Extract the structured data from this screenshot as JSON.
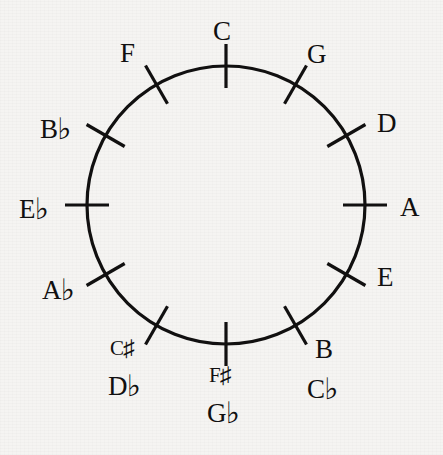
{
  "diagram": {
    "background_color": "#f5f4f2",
    "stroke_color": "#111010",
    "center_x": 226,
    "center_y": 205,
    "radius": 139,
    "tick_inner_offset": 22,
    "tick_outer_offset": 22,
    "circle_stroke_width": 3.2,
    "tick_stroke_width": 3.2,
    "positions_count": 12,
    "degrees_per_position": 30
  },
  "notes": [
    {
      "id": "c",
      "primary": "C",
      "primary_accidental": "",
      "alternate": "",
      "alternate_accidental": "",
      "angle_deg": 0,
      "label_x": 213,
      "label_y": 18
    },
    {
      "id": "g",
      "primary": "G",
      "primary_accidental": "",
      "alternate": "",
      "alternate_accidental": "",
      "angle_deg": 30,
      "label_x": 307,
      "label_y": 41
    },
    {
      "id": "d",
      "primary": "D",
      "primary_accidental": "",
      "alternate": "",
      "alternate_accidental": "",
      "angle_deg": 60,
      "label_x": 377,
      "label_y": 110
    },
    {
      "id": "a",
      "primary": "A",
      "primary_accidental": "",
      "alternate": "",
      "alternate_accidental": "",
      "angle_deg": 90,
      "label_x": 400,
      "label_y": 194
    },
    {
      "id": "e",
      "primary": "E",
      "primary_accidental": "",
      "alternate": "",
      "alternate_accidental": "",
      "angle_deg": 120,
      "label_x": 377,
      "label_y": 264
    },
    {
      "id": "b",
      "primary": "B",
      "primary_accidental": "",
      "alternate": "C",
      "alternate_accidental": "♭",
      "angle_deg": 150,
      "label_x": 307,
      "label_y": 336
    },
    {
      "id": "f-sharp",
      "primary": "F",
      "primary_accidental": "♯",
      "alternate": "G",
      "alternate_accidental": "♭",
      "angle_deg": 180,
      "label_x": 207,
      "label_y": 363
    },
    {
      "id": "c-sharp",
      "primary": "C",
      "primary_accidental": "♯",
      "alternate": "D",
      "alternate_accidental": "♭",
      "angle_deg": 210,
      "label_x": 108,
      "label_y": 336
    },
    {
      "id": "a-flat",
      "primary": "A",
      "primary_accidental": "♭",
      "alternate": "",
      "alternate_accidental": "",
      "angle_deg": 240,
      "label_x": 42,
      "label_y": 274
    },
    {
      "id": "e-flat",
      "primary": "E",
      "primary_accidental": "♭",
      "alternate": "",
      "alternate_accidental": "",
      "angle_deg": 270,
      "label_x": 19,
      "label_y": 193
    },
    {
      "id": "b-flat",
      "primary": "B",
      "primary_accidental": "♭",
      "alternate": "",
      "alternate_accidental": "",
      "angle_deg": 300,
      "label_x": 40,
      "label_y": 113
    },
    {
      "id": "f",
      "primary": "F",
      "primary_accidental": "",
      "alternate": "",
      "alternate_accidental": "",
      "angle_deg": 330,
      "label_x": 120,
      "label_y": 40
    }
  ],
  "chart_data": {
    "type": "diagram",
    "categories": [
      "C",
      "G",
      "D",
      "A",
      "E",
      "B",
      "F♯",
      "C♯",
      "A♭",
      "E♭",
      "B♭",
      "F"
    ],
    "enharmonic_equivalents": {
      "B": "C♭",
      "F♯": "G♭",
      "C♯": "D♭"
    },
    "angles_deg": [
      0,
      30,
      60,
      90,
      120,
      150,
      180,
      210,
      240,
      270,
      300,
      330
    ],
    "grid": false,
    "legend": "none"
  }
}
